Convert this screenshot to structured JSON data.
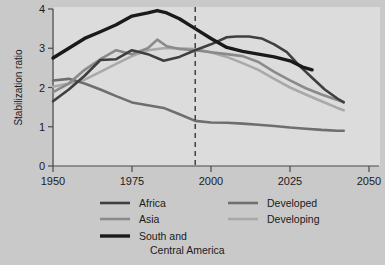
{
  "chart_data": {
    "type": "line",
    "title": "",
    "xlabel": "",
    "ylabel": "Stabilization ratio",
    "xlim": [
      1950,
      2050
    ],
    "ylim": [
      0,
      4
    ],
    "xticks": [
      1950,
      1975,
      2000,
      2025,
      2050
    ],
    "yticks": [
      0,
      1,
      2,
      3,
      4
    ],
    "grid": false,
    "legend_position": "bottom",
    "annotations": [
      {
        "type": "vertical-dashed-line",
        "x": 1995,
        "label": ""
      }
    ],
    "series": [
      {
        "name": "Africa",
        "color": "#3f3f3f",
        "width": 2.6,
        "x": [
          1950,
          1955,
          1960,
          1965,
          1970,
          1975,
          1980,
          1985,
          1990,
          1995,
          2000,
          2005,
          2008,
          2012,
          2016,
          2020,
          2024,
          2028,
          2032,
          2036,
          2040,
          2042
        ],
        "y": [
          1.65,
          1.95,
          2.3,
          2.7,
          2.72,
          2.95,
          2.85,
          2.68,
          2.78,
          2.95,
          3.1,
          3.28,
          3.3,
          3.3,
          3.25,
          3.1,
          2.9,
          2.55,
          2.25,
          1.95,
          1.72,
          1.62
        ]
      },
      {
        "name": "Asia",
        "color": "#8a8a8a",
        "width": 2.6,
        "x": [
          1950,
          1955,
          1960,
          1965,
          1970,
          1975,
          1980,
          1983,
          1986,
          1990,
          1995,
          2000,
          2005,
          2010,
          2015,
          2020,
          2025,
          2030,
          2035,
          2040,
          2042
        ],
        "y": [
          1.88,
          2.1,
          2.45,
          2.72,
          2.95,
          2.85,
          3.0,
          3.22,
          3.05,
          2.98,
          2.95,
          2.9,
          2.85,
          2.8,
          2.65,
          2.4,
          2.18,
          1.98,
          1.82,
          1.68,
          1.63
        ]
      },
      {
        "name": "South and Central America",
        "color": "#1a1a1a",
        "width": 3.4,
        "x": [
          1950,
          1955,
          1960,
          1965,
          1970,
          1975,
          1980,
          1983,
          1986,
          1990,
          1995,
          2000,
          2005,
          2010,
          2015,
          2020,
          2025,
          2029,
          2032
        ],
        "y": [
          2.75,
          3.0,
          3.25,
          3.42,
          3.6,
          3.82,
          3.9,
          3.96,
          3.9,
          3.75,
          3.5,
          3.25,
          3.02,
          2.92,
          2.85,
          2.78,
          2.68,
          2.52,
          2.45
        ]
      },
      {
        "name": "Developed",
        "color": "#6e6e6e",
        "width": 2.6,
        "x": [
          1950,
          1955,
          1960,
          1965,
          1970,
          1975,
          1980,
          1985,
          1990,
          1995,
          2000,
          2005,
          2010,
          2015,
          2020,
          2025,
          2030,
          2035,
          2040,
          2042
        ],
        "y": [
          2.18,
          2.22,
          2.1,
          1.95,
          1.78,
          1.62,
          1.55,
          1.48,
          1.32,
          1.15,
          1.11,
          1.1,
          1.08,
          1.05,
          1.02,
          0.98,
          0.95,
          0.92,
          0.9,
          0.9
        ]
      },
      {
        "name": "Developing",
        "color": "#a9a9a9",
        "width": 2.6,
        "x": [
          1950,
          1955,
          1960,
          1965,
          1970,
          1975,
          1980,
          1985,
          1990,
          1995,
          2000,
          2005,
          2010,
          2015,
          2020,
          2025,
          2030,
          2035,
          2040,
          2042
        ],
        "y": [
          2.02,
          2.1,
          2.2,
          2.4,
          2.6,
          2.8,
          2.95,
          3.0,
          3.0,
          2.98,
          2.9,
          2.78,
          2.62,
          2.45,
          2.22,
          2.0,
          1.82,
          1.65,
          1.48,
          1.42
        ]
      }
    ]
  },
  "axes": {
    "y_title": "Stabilization ratio",
    "y_tick_labels": [
      "0",
      "1",
      "2",
      "3",
      "4"
    ],
    "x_tick_labels": [
      "1950",
      "1975",
      "2000",
      "2025",
      "2050"
    ]
  },
  "legend": {
    "entries": [
      {
        "label": "Africa",
        "color": "#3f3f3f",
        "width": 2.6
      },
      {
        "label": "Asia",
        "color": "#8a8a8a",
        "width": 2.6
      },
      {
        "label": "South and",
        "label2": "Central America",
        "color": "#1a1a1a",
        "width": 3.4
      },
      {
        "label": "Developed",
        "color": "#6e6e6e",
        "width": 2.6
      },
      {
        "label": "Developing",
        "color": "#a9a9a9",
        "width": 2.6
      }
    ]
  },
  "colors": {
    "page_background": "#c9c9c9",
    "plot_background": "#dcdcdc",
    "axis": "#4a4a4a",
    "text": "#1b1b1b",
    "marker_line": "#2a2a2a"
  }
}
